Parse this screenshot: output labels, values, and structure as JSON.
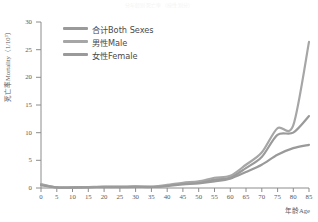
{
  "figure": {
    "faint_top_text": "分年龄别死亡率（按性别分）"
  },
  "axes": {
    "y_title": "死亡率Mortality（1/10³）",
    "x_title": "年龄Age",
    "y_ticks": [
      "0",
      "5",
      "10",
      "15",
      "20",
      "25",
      "30"
    ],
    "x_ticks": [
      "0",
      "5",
      "10",
      "15",
      "20",
      "25",
      "30",
      "35",
      "40",
      "45",
      "50",
      "55",
      "60",
      "65",
      "70",
      "75",
      "80",
      "85"
    ]
  },
  "legend": {
    "items": [
      {
        "label": "合计Both Sexes",
        "color": "#9a9a9a"
      },
      {
        "label": "男性Male",
        "color": "#a6a6a6"
      },
      {
        "label": "女性Female",
        "color": "#9a9a9a"
      }
    ]
  },
  "colors": {
    "line": "#9a9a9a",
    "axis": "#8c8c8c",
    "text": "#5a5a5a"
  },
  "chart_data": {
    "type": "line",
    "title": "分年龄别死亡率（按性别分）",
    "xlabel": "年龄Age",
    "ylabel": "死亡率Mortality（1/10³）",
    "xlim": [
      0,
      85
    ],
    "ylim": [
      0,
      30
    ],
    "grid": false,
    "legend_position": "top-left",
    "x": [
      0,
      5,
      10,
      15,
      20,
      25,
      30,
      35,
      40,
      45,
      50,
      55,
      60,
      65,
      70,
      75,
      80,
      85
    ],
    "series": [
      {
        "name": "合计Both Sexes",
        "values": [
          0.6,
          0.1,
          0.1,
          0.15,
          0.2,
          0.2,
          0.25,
          0.2,
          0.45,
          0.8,
          1.0,
          1.5,
          1.9,
          3.6,
          5.6,
          9.6,
          10.0,
          13.0
        ]
      },
      {
        "name": "男性Male",
        "values": [
          0.7,
          0.1,
          0.12,
          0.18,
          0.25,
          0.25,
          0.3,
          0.25,
          0.55,
          0.95,
          1.2,
          1.85,
          2.2,
          4.2,
          6.4,
          10.8,
          11.3,
          26.4
        ]
      },
      {
        "name": "女性Female",
        "values": [
          0.5,
          0.1,
          0.08,
          0.12,
          0.15,
          0.15,
          0.2,
          0.18,
          0.35,
          0.65,
          0.85,
          1.2,
          1.7,
          2.9,
          4.2,
          6.0,
          7.2,
          7.8
        ]
      }
    ],
    "endpoints_at_85": {
      "合计Both Sexes": 14.6,
      "男性Male": 26.4,
      "女性Female": 7.8
    }
  }
}
